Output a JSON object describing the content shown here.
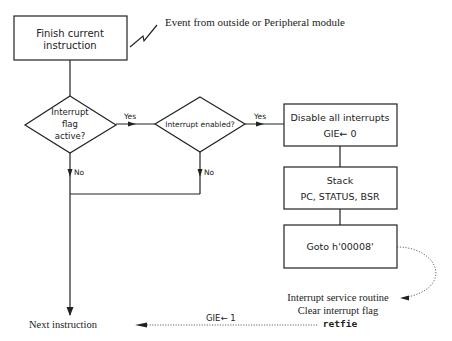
{
  "diagram": {
    "type": "flowchart",
    "nodes": {
      "finish": {
        "label_line1": "Finish  current",
        "label_line2": "instruction"
      },
      "event": {
        "label": "Event from outside or Peripheral module"
      },
      "flag_decision": {
        "line1": "Interrupt",
        "line2": "flag",
        "line3": "active?"
      },
      "enabled_decision": {
        "label": "Interrupt enabled?"
      },
      "disable": {
        "line1": "Disable all interrupts",
        "line2": "GIE← 0"
      },
      "stack": {
        "line1": "Stack",
        "line2": "PC, STATUS, BSR"
      },
      "goto": {
        "label": "Goto  h'00008'"
      },
      "isr": {
        "line1": "Interrupt  service  routine",
        "line2": "Clear interrupt flag",
        "line3": "retfie"
      },
      "next": {
        "label": "Next  instruction"
      }
    },
    "edges": {
      "yes1": "Yes",
      "yes2": "Yes",
      "no1": "No",
      "no2": "No",
      "gie_set": "GIE← 1"
    }
  }
}
